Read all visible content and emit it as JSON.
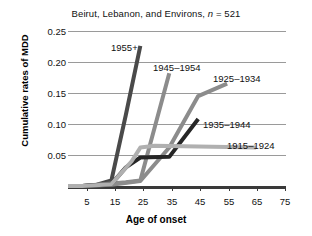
{
  "chart_data": {
    "type": "line",
    "title": "Beirut, Lebanon, and Environs, n = 521",
    "title_prefix": "Beirut, Lebanon, and Environs, ",
    "title_n_italic": "n",
    "title_suffix": " = 521",
    "xlabel": "Age of onset",
    "ylabel": "Cumulative rates of MDD",
    "xlim": [
      0,
      75
    ],
    "ylim": [
      0,
      0.25
    ],
    "xticks": [
      5,
      15,
      25,
      35,
      45,
      55,
      65,
      75
    ],
    "xtick_labels": [
      "5",
      "15",
      "25",
      "35",
      "45",
      "55",
      "65",
      "75"
    ],
    "yticks": [
      0.05,
      0.1,
      0.15,
      0.2,
      0.25
    ],
    "ytick_labels": [
      "0.05",
      "0.10",
      "0.15",
      "0.20",
      "0.25"
    ],
    "grid": true,
    "legend_position": "inline-annotations",
    "series": [
      {
        "name": "1955+",
        "color": "#4a4a4a",
        "x": [
          0,
          5,
          10,
          15,
          20,
          25
        ],
        "y": [
          0.0,
          0.0,
          0.002,
          0.009,
          0.115,
          0.226
        ]
      },
      {
        "name": "1945–1954",
        "color": "#8c8c8c",
        "x": [
          0,
          5,
          15,
          20,
          25,
          30,
          35
        ],
        "y": [
          0.0,
          0.0,
          0.004,
          0.006,
          0.009,
          0.095,
          0.182
        ]
      },
      {
        "name": "1925–1934",
        "color": "#8c8c8c",
        "x": [
          0,
          5,
          15,
          25,
          35,
          45,
          55
        ],
        "y": [
          0.0,
          0.0,
          0.002,
          0.008,
          0.062,
          0.145,
          0.165
        ]
      },
      {
        "name": "1935–1944",
        "color": "#262626",
        "x": [
          0,
          5,
          15,
          20,
          25,
          35,
          45
        ],
        "y": [
          0.0,
          0.0,
          0.003,
          0.03,
          0.046,
          0.047,
          0.108
        ]
      },
      {
        "name": "1915–1924",
        "color": "#b0b0b0",
        "x": [
          0,
          5,
          15,
          22,
          25,
          30,
          65
        ],
        "y": [
          0.0,
          0.0,
          0.003,
          0.04,
          0.062,
          0.065,
          0.062
        ]
      }
    ],
    "annotations": [
      {
        "text": "1955+",
        "x_px": 111,
        "y_px": 42
      },
      {
        "text": "1945–1954",
        "x_px": 153,
        "y_px": 62
      },
      {
        "text": "1925–1934",
        "x_px": 213,
        "y_px": 73
      },
      {
        "text": "1935–1944",
        "x_px": 203,
        "y_px": 119
      },
      {
        "text": "1915–1924",
        "x_px": 227,
        "y_px": 140
      }
    ]
  }
}
